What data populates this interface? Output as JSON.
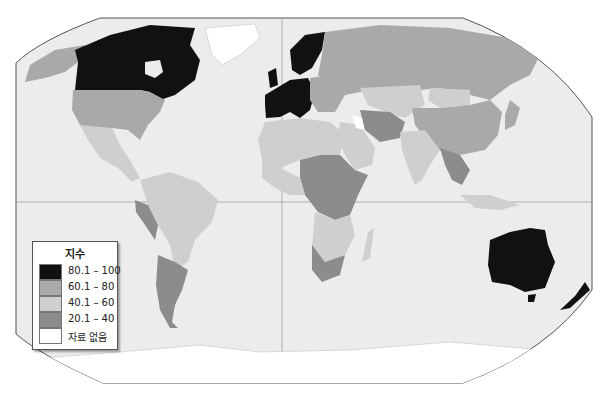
{
  "map": {
    "title": "",
    "projection": "Robinson-like world map",
    "ocean_color": "#ececec",
    "frame_color": "#555555",
    "grid": {
      "equator": true,
      "prime_meridian": true
    }
  },
  "legend": {
    "title": "지수",
    "items": [
      {
        "label": "80.1 – 100",
        "color": "#111111"
      },
      {
        "label": "60.1 – 80",
        "color": "#a9a9a9"
      },
      {
        "label": "40.1 – 60",
        "color": "#cfcfcf"
      },
      {
        "label": "20.1 – 40",
        "color": "#8c8c8c"
      },
      {
        "label": "자료 없음",
        "color": "#ffffff"
      }
    ]
  },
  "regions": [
    {
      "name": "Canada",
      "class": "80.1 – 100"
    },
    {
      "name": "United States",
      "class": "60.1 – 80"
    },
    {
      "name": "Alaska",
      "class": "60.1 – 80"
    },
    {
      "name": "Greenland",
      "class": "자료 없음"
    },
    {
      "name": "Mexico & Central America",
      "class": "40.1 – 60"
    },
    {
      "name": "Northern South America",
      "class": "40.1 – 60"
    },
    {
      "name": "Peru",
      "class": "20.1 – 40"
    },
    {
      "name": "Argentina",
      "class": "20.1 – 40"
    },
    {
      "name": "Western Europe",
      "class": "80.1 – 100"
    },
    {
      "name": "Scandinavia",
      "class": "80.1 – 100"
    },
    {
      "name": "Russia",
      "class": "60.1 – 80"
    },
    {
      "name": "Central Asia",
      "class": "40.1 – 60"
    },
    {
      "name": "China",
      "class": "60.1 – 80"
    },
    {
      "name": "Mongolia",
      "class": "40.1 – 60"
    },
    {
      "name": "India",
      "class": "40.1 – 60"
    },
    {
      "name": "Iran & Afghanistan",
      "class": "20.1 – 40"
    },
    {
      "name": "Arabian Peninsula",
      "class": "40.1 – 60"
    },
    {
      "name": "North Africa",
      "class": "40.1 – 60"
    },
    {
      "name": "Central Africa",
      "class": "20.1 – 40"
    },
    {
      "name": "Southern Africa",
      "class": "40.1 – 60"
    },
    {
      "name": "South Africa",
      "class": "20.1 – 40"
    },
    {
      "name": "Madagascar",
      "class": "40.1 – 60"
    },
    {
      "name": "Southeast Asia",
      "class": "20.1 – 40"
    },
    {
      "name": "Japan",
      "class": "60.1 – 80"
    },
    {
      "name": "Australia",
      "class": "80.1 – 100"
    },
    {
      "name": "New Zealand",
      "class": "80.1 – 100"
    },
    {
      "name": "Antarctica",
      "class": "자료 없음"
    }
  ]
}
